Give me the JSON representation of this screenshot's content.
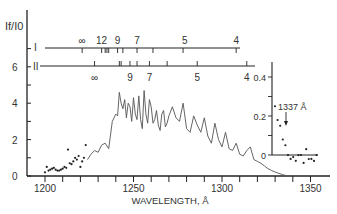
{
  "chart_data": {
    "type": "line",
    "title": "",
    "ylabel": "I_f / I_0",
    "xlabel": "WAVELENGTH, Å",
    "xlim": [
      1190,
      1360
    ],
    "ylim": [
      0,
      7
    ],
    "x_ticks": [
      1200,
      1250,
      1300,
      1350
    ],
    "y_ticks": [
      0,
      2,
      4,
      6
    ],
    "series": [
      {
        "name": "Fluorescence spectrum (line)",
        "style": "line",
        "x": [
          1224,
          1226,
          1228,
          1230,
          1232,
          1234,
          1236,
          1238,
          1240,
          1241,
          1242,
          1243,
          1244,
          1245,
          1246,
          1247,
          1248,
          1249,
          1250,
          1251,
          1252,
          1253,
          1254,
          1255,
          1256,
          1257,
          1258,
          1259,
          1260,
          1261,
          1262,
          1263,
          1264,
          1265,
          1266,
          1267,
          1268,
          1269,
          1270,
          1272,
          1274,
          1276,
          1278,
          1280,
          1282,
          1284,
          1286,
          1288,
          1290,
          1292,
          1294,
          1296,
          1298,
          1300,
          1302,
          1304,
          1306,
          1308,
          1310,
          1312,
          1314,
          1316,
          1318,
          1320,
          1322,
          1324,
          1326,
          1328,
          1330,
          1332,
          1334,
          1336,
          1337
        ],
        "y": [
          0.9,
          1.2,
          1.4,
          1.3,
          1.7,
          1.8,
          1.5,
          3.0,
          3.4,
          3.3,
          4.6,
          4.0,
          3.7,
          4.2,
          3.2,
          4.0,
          3.8,
          3.0,
          4.3,
          3.4,
          3.1,
          4.4,
          3.1,
          2.6,
          4.7,
          3.4,
          2.9,
          4.2,
          3.8,
          2.9,
          3.1,
          3.6,
          2.8,
          2.5,
          3.4,
          3.6,
          2.7,
          2.9,
          3.3,
          3.8,
          3.2,
          3.0,
          4.0,
          2.6,
          2.4,
          3.3,
          2.8,
          2.4,
          3.2,
          2.2,
          1.8,
          2.9,
          2.0,
          1.6,
          2.4,
          1.5,
          1.4,
          1.8,
          1.2,
          1.1,
          1.4,
          1.6,
          0.9,
          0.8,
          0.7,
          0.55,
          0.4,
          0.3,
          0.22,
          0.15,
          0.08,
          0.03,
          0.0
        ]
      },
      {
        "name": "Fluorescence (points, short wavelength)",
        "style": "scatter",
        "x": [
          1200,
          1201,
          1202,
          1203,
          1204,
          1205,
          1206,
          1207,
          1208,
          1209,
          1210,
          1211,
          1212,
          1213,
          1214,
          1215,
          1216,
          1217,
          1218,
          1219,
          1220,
          1221,
          1222,
          1223
        ],
        "y": [
          0.2,
          0.5,
          0.3,
          0.35,
          0.4,
          0.45,
          0.35,
          0.3,
          0.3,
          0.35,
          0.4,
          0.5,
          0.45,
          1.45,
          0.7,
          0.65,
          0.8,
          1.0,
          0.9,
          1.1,
          0.5,
          0.8,
          1.0,
          1.7
        ]
      }
    ],
    "band_series": [
      {
        "name": "I",
        "labels": [
          {
            "text": "∞",
            "x": 1221
          },
          {
            "text": "12",
            "x": 1232
          },
          {
            "text": "9",
            "x": 1241
          },
          {
            "text": "7",
            "x": 1252
          },
          {
            "text": "5",
            "x": 1279
          },
          {
            "text": "4",
            "x": 1308
          }
        ],
        "tick_x": [
          1221,
          1232,
          1234,
          1235,
          1236,
          1241,
          1244,
          1252,
          1261,
          1278,
          1308
        ]
      },
      {
        "name": "II",
        "labels": [
          {
            "text": "∞",
            "x": 1228
          },
          {
            "text": "9",
            "x": 1248
          },
          {
            "text": "7",
            "x": 1259
          },
          {
            "text": "5",
            "x": 1286
          },
          {
            "text": "4",
            "x": 1314
          }
        ],
        "tick_x": [
          1228,
          1242,
          1243,
          1248,
          1252,
          1259,
          1269,
          1286,
          1314
        ]
      }
    ],
    "inset": {
      "ylim": [
        0,
        0.5
      ],
      "y_ticks": [
        0,
        0.2,
        0.4
      ],
      "annotation": "1337 Å",
      "points_x": [
        1336,
        1337,
        1338,
        1339,
        1340,
        1341,
        1342,
        1343,
        1344,
        1345,
        1346,
        1347,
        1348,
        1349,
        1350,
        1351,
        1352
      ],
      "points_y": [
        0.25,
        0.2,
        0.15,
        0.1,
        0.05,
        0.02,
        -0.02,
        0.01,
        -0.03,
        0.02,
        0.0,
        -0.02,
        0.03,
        0.0,
        -0.02,
        -0.01,
        0.0
      ]
    },
    "grid": false,
    "legend": "none"
  },
  "axis": {
    "ylabel": "If/I0",
    "xlabel": "WAVELENGTH, Å",
    "x_tick_labels": [
      "1200",
      "1250",
      "1300",
      "1350"
    ],
    "y_tick_labels": [
      "0",
      "2",
      "4",
      "6"
    ],
    "series_I_label": "I",
    "series_II_label": "II",
    "inset_y_labels": [
      "0",
      "0.2",
      "0.4"
    ],
    "inset_annotation": "1337 Å"
  }
}
